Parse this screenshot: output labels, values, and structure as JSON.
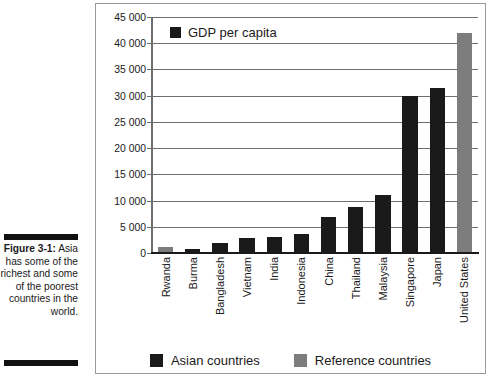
{
  "figure": {
    "label": "Figure 3-1:",
    "caption": "Asia has some of the richest and some of the poorest countries in the world."
  },
  "chart_data": {
    "type": "bar",
    "title": "GDP per capita",
    "xlabel": "",
    "ylabel": "",
    "ylim": [
      0,
      45000
    ],
    "grid": true,
    "legend_position": "bottom",
    "ytick_labels": [
      "45 000",
      "40 000",
      "35 000",
      "30 000",
      "25 000",
      "20 000",
      "15 000",
      "10 000",
      "5 000",
      "0"
    ],
    "ytick_values": [
      45000,
      40000,
      35000,
      30000,
      25000,
      20000,
      15000,
      10000,
      5000,
      0
    ],
    "categories": [
      "Rwanda",
      "Burma",
      "Bangladesh",
      "Vietnam",
      "India",
      "Indonesia",
      "China",
      "Thailand",
      "Malaysia",
      "Singapore",
      "Japan",
      "United States"
    ],
    "values": [
      1100,
      800,
      1900,
      2900,
      3100,
      3600,
      6800,
      8700,
      11000,
      29900,
      31500,
      42000
    ],
    "groups": [
      "reference",
      "asian",
      "asian",
      "asian",
      "asian",
      "asian",
      "asian",
      "asian",
      "asian",
      "asian",
      "asian",
      "reference"
    ],
    "legend": [
      {
        "key": "asian",
        "label": "Asian countries",
        "color": "#1a1a1a"
      },
      {
        "key": "reference",
        "label": "Reference countries",
        "color": "#7d7d7d"
      }
    ]
  },
  "colors": {
    "asian": "#1a1a1a",
    "reference": "#7d7d7d",
    "grid": "#6e6e6e",
    "frame": "#9b9b9b"
  }
}
